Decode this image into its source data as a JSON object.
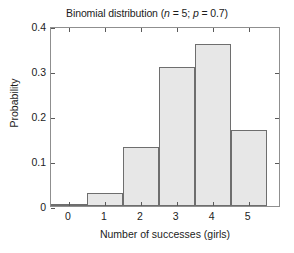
{
  "chart_data": {
    "type": "bar",
    "title": "Binomial distribution (n = 5; p = 0.7)",
    "title_parts": {
      "lead": "Binomial distribution (",
      "n_sym": "n",
      "n_eq": " = 5; ",
      "p_sym": "p",
      "p_eq": " = 0.7)"
    },
    "xlabel": "Number of successes (girls)",
    "ylabel": "Probability",
    "categories": [
      "0",
      "1",
      "2",
      "3",
      "4",
      "5"
    ],
    "values": [
      0.002,
      0.028,
      0.132,
      0.309,
      0.36,
      0.168
    ],
    "xlim": [
      -0.5,
      5.9
    ],
    "ylim": [
      0,
      0.4
    ],
    "yticks": [
      0,
      0.1,
      0.2,
      0.3,
      0.4
    ],
    "ytick_labels": [
      "0",
      "0.1",
      "0.2",
      "0.3",
      "0.4"
    ],
    "xticks": [
      0,
      1,
      2,
      3,
      4,
      5
    ],
    "xtick_labels": [
      "0",
      "1",
      "2",
      "3",
      "4",
      "5"
    ],
    "grid": false,
    "legend": null,
    "bar_fill_color": "#e7e7e7",
    "bar_edge_color": "#6e6e6e",
    "axis_color": "#8f8f8f",
    "text_color": "#1c1c1c",
    "background_color": "#ffffff"
  }
}
